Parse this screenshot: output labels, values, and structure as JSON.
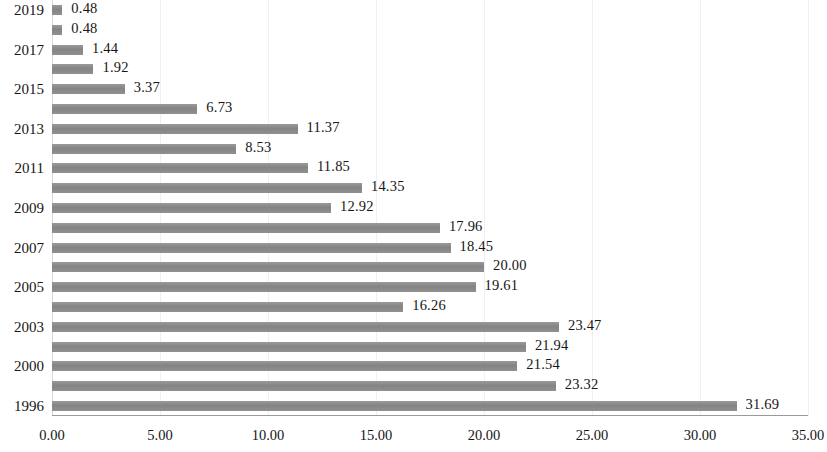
{
  "chart_data": {
    "type": "bar",
    "orientation": "horizontal",
    "title": "",
    "subtitle": "",
    "xlabel": "",
    "ylabel": "",
    "xlim": [
      0,
      35
    ],
    "ylim": null,
    "grid": true,
    "grid_axis": "x",
    "legend": null,
    "legend_position": "none",
    "bar_color": "#8d8d8d",
    "axis_color": "#9a9a9a",
    "gridline_color": "#f0f0f0",
    "label_color": "#161616",
    "x_ticks": [
      "0.00",
      "5.00",
      "10.00",
      "15.00",
      "20.00",
      "25.00",
      "30.00",
      "35.00"
    ],
    "x_tick_values": [
      0,
      5,
      10,
      15,
      20,
      25,
      30,
      35
    ],
    "categories": [
      "2019",
      "2018",
      "2017",
      "2016",
      "2015",
      "2014",
      "2013",
      "2012",
      "2011",
      "2010",
      "2009",
      "2008",
      "2007",
      "2006",
      "2005",
      "2004",
      "2003",
      "2002",
      "2000",
      "1998",
      "1996"
    ],
    "category_labels_shown": [
      "2019",
      "",
      "2017",
      "",
      "2015",
      "",
      "2013",
      "",
      "2011",
      "",
      "2009",
      "",
      "2007",
      "",
      "2005",
      "",
      "2003",
      "",
      "2000",
      "",
      "1996"
    ],
    "values": [
      0.48,
      0.48,
      1.44,
      1.92,
      3.37,
      6.73,
      11.37,
      8.53,
      11.85,
      14.35,
      12.92,
      17.96,
      18.45,
      20.0,
      19.61,
      16.26,
      23.47,
      21.94,
      21.54,
      23.32,
      31.69
    ],
    "value_labels": [
      "0.48",
      "0.48",
      "1.44",
      "1.92",
      "3.37",
      "6.73",
      "11.37",
      "8.53",
      "11.85",
      "14.35",
      "12.92",
      "17.96",
      "18.45",
      "20.00",
      "19.61",
      "16.26",
      "23.47",
      "21.94",
      "21.54",
      "23.32",
      "31.69"
    ]
  }
}
